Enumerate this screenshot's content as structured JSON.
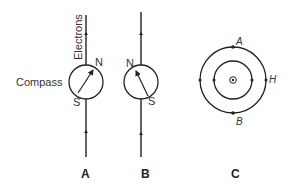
{
  "figure": {
    "panels": [
      {
        "label": "A",
        "wire_label": "Electrons",
        "compass_label": "Compass",
        "needle_north": "N",
        "needle_south": "S"
      },
      {
        "label": "B",
        "needle_north": "N",
        "needle_south": "S"
      },
      {
        "label": "C",
        "points": {
          "top": "A",
          "right": "H",
          "bottom": "B"
        },
        "center_symbol": "current-into-page"
      }
    ]
  },
  "colors": {
    "ink": "#222222",
    "text": "#333333",
    "background": "#ffffff"
  }
}
